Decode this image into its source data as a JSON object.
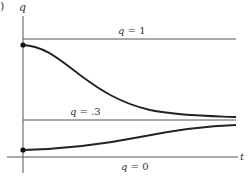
{
  "figure": {
    "panel_label": ")",
    "axes": {
      "y_label": "q",
      "x_label": "t"
    },
    "reference_lines": [
      {
        "name": "q-equals-1",
        "label_var": "q",
        "label_eq": " = 1",
        "value": 1
      },
      {
        "name": "q-equals-point-3",
        "label_var": "q",
        "label_eq": " = .3",
        "value": 0.3
      },
      {
        "name": "q-equals-0",
        "label_var": "q",
        "label_eq": " = 0",
        "value": 0
      }
    ],
    "curves": [
      {
        "name": "decaying-solution",
        "start": "q slightly below 1",
        "approaches": 0.3,
        "behavior": "decreasing"
      },
      {
        "name": "rising-solution",
        "start": "q slightly above 0",
        "approaches": 0.3,
        "behavior": "increasing"
      }
    ],
    "colors": {
      "axis": "#555555",
      "curve": "#222222",
      "line": "#555555"
    }
  }
}
